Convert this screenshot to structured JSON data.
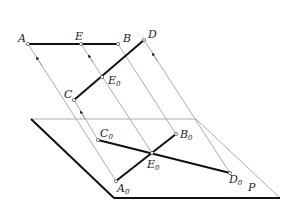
{
  "diagram": {
    "labels": {
      "A": "A",
      "E": "E",
      "B": "B",
      "D": "D",
      "E0_upper": "E",
      "C": "C",
      "C0": "C",
      "B0": "B",
      "E0": "E",
      "A0": "A",
      "D0": "D",
      "P": "P",
      "sub0": "0"
    },
    "points": {
      "A": [
        28,
        44
      ],
      "E": [
        81,
        44
      ],
      "B": [
        118,
        44
      ],
      "D": [
        144,
        40
      ],
      "E0_upper": [
        102,
        77
      ],
      "C": [
        74,
        100
      ],
      "C0": [
        98,
        140
      ],
      "B0": [
        176,
        134
      ],
      "E0": [
        152,
        153
      ],
      "A0": [
        116,
        181
      ],
      "D0": [
        230,
        173
      ]
    },
    "plane": {
      "top_left": [
        31,
        119
      ],
      "top_right": [
        196,
        119
      ],
      "bottom_right": [
        280,
        198
      ],
      "bottom_left": [
        114,
        198
      ]
    },
    "colors": {
      "thick_line": "#111111",
      "projection_line": "#888888",
      "background": "#ffffff"
    }
  }
}
